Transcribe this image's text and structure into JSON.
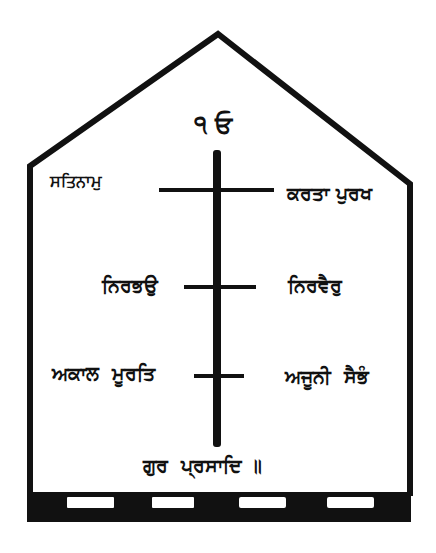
{
  "diagram": {
    "type": "mool-mantar-house-diagram",
    "colors": {
      "ink": "#111111",
      "background": "#ffffff"
    },
    "top": {
      "symbol": "ੴ",
      "label": "੧ ਓ"
    },
    "rows": [
      {
        "left": "ਸਤਿਨਾਮੁ",
        "right": "ਕਰਤਾ ਪੁਰਖ"
      },
      {
        "left": "ਨਿਰਭਉ",
        "right": "ਨਿਰਵੈਰੁ"
      },
      {
        "left": "ਅਕਾਲ  ਮੂਰਤਿ",
        "right": "ਅਜੂਨੀ  ਸੈਭੰ"
      }
    ],
    "bottom": {
      "label": "ਗੁਰ  ਪ੍ਰਸਾਦਿ ॥"
    },
    "base": {
      "slots": 4
    }
  }
}
